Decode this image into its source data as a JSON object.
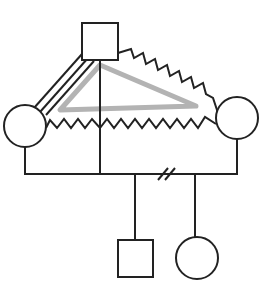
{
  "diagram": {
    "type": "genogram",
    "colors": {
      "line": "#222222",
      "triangle": "#b3b3b3",
      "background": "#ffffff"
    },
    "nodes": [
      {
        "id": "top-male",
        "shape": "square",
        "sex": "male"
      },
      {
        "id": "left-female",
        "shape": "circle",
        "sex": "female"
      },
      {
        "id": "right-female",
        "shape": "circle",
        "sex": "female"
      },
      {
        "id": "child-male",
        "shape": "square",
        "sex": "male"
      },
      {
        "id": "child-female",
        "shape": "circle",
        "sex": "female"
      }
    ],
    "relationships": [
      {
        "from": "top-male",
        "to": "left-female",
        "style": "triple-line",
        "meaning": "fused"
      },
      {
        "from": "top-male",
        "to": "right-female",
        "style": "zigzag",
        "meaning": "conflict"
      },
      {
        "from": "left-female",
        "to": "right-female",
        "style": "zigzag",
        "meaning": "conflict"
      },
      {
        "from": "top-male",
        "to": "left-female",
        "style": "triangle",
        "meaning": "triangulation",
        "third": "right-female"
      }
    ],
    "family_line": {
      "marker": "double-slash",
      "meaning": "divorce"
    }
  }
}
